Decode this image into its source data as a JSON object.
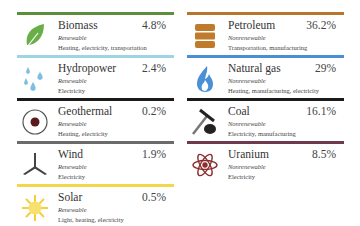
{
  "renewable": [
    {
      "name": "Biomass",
      "percent": "4.8%",
      "type": "Renewable",
      "uses": "Heating, electricity, transportation",
      "icon": "leaf-icon",
      "color": "#5a8f3c"
    },
    {
      "name": "Hydropower",
      "percent": "2.4%",
      "type": "Renewable",
      "uses": "Electricity",
      "icon": "water-drops-icon",
      "color": "#9fd3e6"
    },
    {
      "name": "Geothermal",
      "percent": "0.2%",
      "type": "Renewable",
      "uses": "Heating, electricity",
      "icon": "geothermal-icon",
      "color": "#1a1a1a"
    },
    {
      "name": "Wind",
      "percent": "1.9%",
      "type": "Renewable",
      "uses": "Electricity",
      "icon": "wind-turbine-icon",
      "color": "#6b6b6b"
    },
    {
      "name": "Solar",
      "percent": "0.5%",
      "type": "Renewable",
      "uses": "Light, heating, electricity",
      "icon": "sun-icon",
      "color": "#f2d64b"
    }
  ],
  "nonrenewable": [
    {
      "name": "Petroleum",
      "percent": "36.2%",
      "type": "Nonrenewable",
      "uses": "Transportation, manufacturing",
      "icon": "oil-barrel-icon",
      "color": "#b8752e"
    },
    {
      "name": "Natural gas",
      "percent": "29%",
      "type": "Nonrenewable",
      "uses": "Heating, manufacturing, electricity",
      "icon": "flame-icon",
      "color": "#4a8fd4"
    },
    {
      "name": "Coal",
      "percent": "16.1%",
      "type": "Nonrenewable",
      "uses": "Electricity, manufacturing",
      "icon": "coal-pickaxe-icon",
      "color": "#1a1a1a"
    },
    {
      "name": "Uranium",
      "percent": "8.5%",
      "type": "Nonrenewable",
      "uses": "Electricity",
      "icon": "atom-icon",
      "color": "#6e3a4e"
    }
  ]
}
